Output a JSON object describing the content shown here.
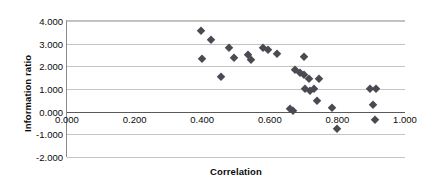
{
  "chart_data": {
    "type": "scatter",
    "title": "",
    "xlabel": "Correlation",
    "ylabel": "Information ratio",
    "xlim": [
      0.0,
      1.0
    ],
    "ylim": [
      -2.0,
      4.0
    ],
    "xticks": [
      "0.000",
      "0.200",
      "0.400",
      "0.600",
      "0.800",
      "1.000"
    ],
    "xtick_values": [
      0.0,
      0.2,
      0.4,
      0.6,
      0.8,
      1.0
    ],
    "yticks": [
      "-2.000",
      "-1.000",
      "0.000",
      "1.000",
      "2.000",
      "3.000",
      "4.000"
    ],
    "ytick_values": [
      -2.0,
      -1.0,
      0.0,
      1.0,
      2.0,
      3.0,
      4.0
    ],
    "grid": "horizontal",
    "legend": "none",
    "marker": "filled-diamond",
    "marker_color": "#4a4a52",
    "series": [
      {
        "name": "observations",
        "points": [
          [
            0.395,
            3.55
          ],
          [
            0.425,
            3.18
          ],
          [
            0.4,
            2.32
          ],
          [
            0.455,
            1.52
          ],
          [
            0.48,
            2.8
          ],
          [
            0.495,
            2.35
          ],
          [
            0.535,
            2.48
          ],
          [
            0.545,
            2.3
          ],
          [
            0.58,
            2.82
          ],
          [
            0.595,
            2.7
          ],
          [
            0.62,
            2.55
          ],
          [
            0.7,
            2.42
          ],
          [
            0.675,
            1.85
          ],
          [
            0.69,
            1.7
          ],
          [
            0.7,
            1.62
          ],
          [
            0.715,
            1.45
          ],
          [
            0.745,
            1.42
          ],
          [
            0.705,
            0.98
          ],
          [
            0.72,
            0.92
          ],
          [
            0.73,
            0.98
          ],
          [
            0.74,
            0.45
          ],
          [
            0.66,
            0.1
          ],
          [
            0.668,
            0.02
          ],
          [
            0.785,
            0.18
          ],
          [
            0.8,
            -0.75
          ],
          [
            0.895,
            1.02
          ],
          [
            0.915,
            1.0
          ],
          [
            0.905,
            0.28
          ],
          [
            0.91,
            -0.38
          ]
        ]
      }
    ]
  }
}
